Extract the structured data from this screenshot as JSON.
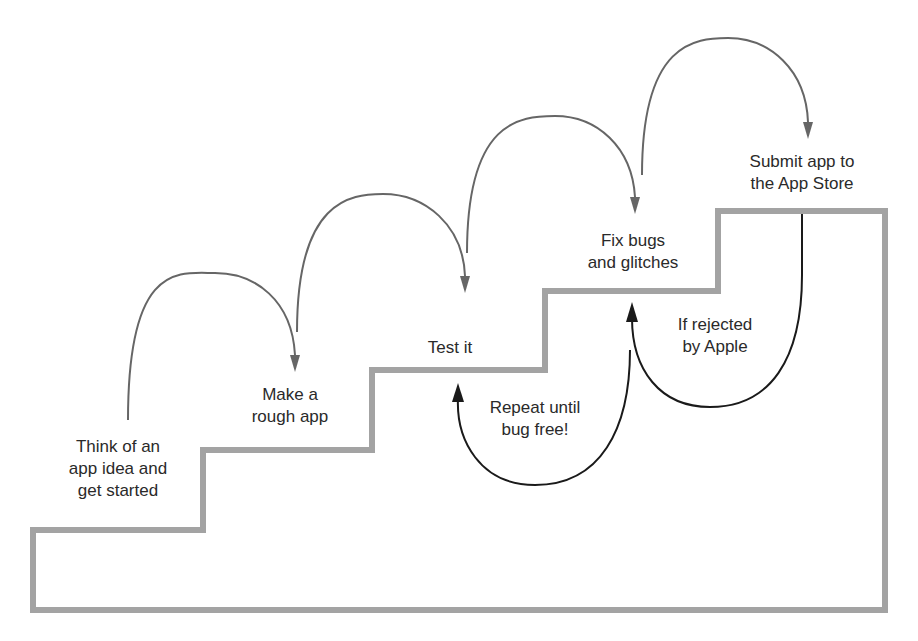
{
  "diagram": {
    "type": "staircase-process",
    "steps": [
      {
        "id": "step-1",
        "label": "Think of an\napp idea and\nget started"
      },
      {
        "id": "step-2",
        "label": "Make a\nrough app"
      },
      {
        "id": "step-3",
        "label": "Test it"
      },
      {
        "id": "step-4",
        "label": "Fix bugs\nand glitches"
      },
      {
        "id": "step-5",
        "label": "Submit app to\nthe App Store"
      }
    ],
    "loops": [
      {
        "id": "loop-1",
        "from": "step-4",
        "to": "step-3",
        "label": "Repeat until\nbug free!"
      },
      {
        "id": "loop-2",
        "from": "step-5",
        "to": "step-4",
        "label": "If rejected\nby Apple"
      }
    ],
    "colors": {
      "stair": "#a3a3a3",
      "forward_arrow": "#666666",
      "loop_arrow": "#1a1a1a",
      "text": "#2a2a2a"
    }
  }
}
